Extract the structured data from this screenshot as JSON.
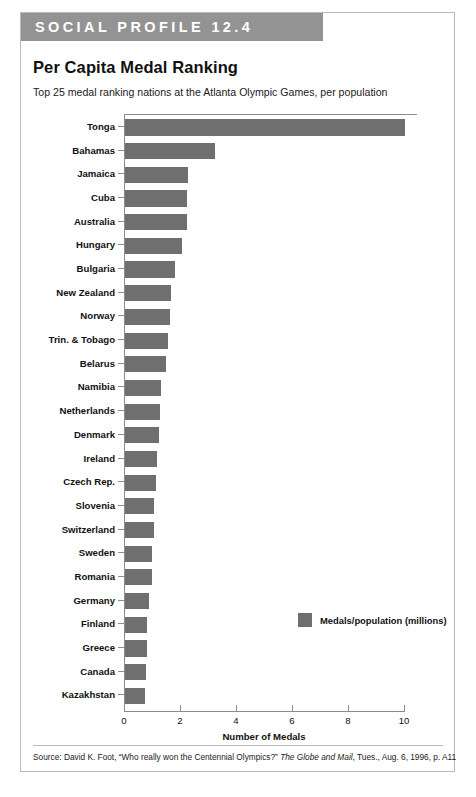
{
  "banner": {
    "label": "SOCIAL PROFILE 12.4"
  },
  "title": "Per Capita Medal Ranking",
  "subtitle": "Top 25 medal ranking nations at the Atlanta Olympic Games, per population",
  "legend": {
    "label": "Medals/population (millions)",
    "swatch_color": "#6f6f6f"
  },
  "source": {
    "prefix": "Source: David K. Foot, “Who really won the Centennial Olympics?” ",
    "publication": "The Globe and Mail",
    "suffix": ", Tues., Aug. 6, 1996, p. A11"
  },
  "colors": {
    "bar": "#6f6f6f",
    "banner": "#939393",
    "axis": "#8d8d8d",
    "card_border": "#b9b9b9",
    "background": "#ffffff"
  },
  "chart_data": {
    "type": "bar",
    "orientation": "horizontal",
    "title": "Per Capita Medal Ranking",
    "subtitle": "Top 25 medal ranking nations at the Atlanta Olympic Games, per population",
    "xlabel": "Number of Medals",
    "ylabel": "",
    "xlim": [
      0,
      10
    ],
    "xticks": [
      0,
      2,
      4,
      6,
      8,
      10
    ],
    "xtick_labels": [
      "0",
      "2",
      "4",
      "6",
      "8",
      "10"
    ],
    "grid": false,
    "legend_position": "inside-right",
    "series_name": "Medals/population (millions)",
    "categories": [
      "Tonga",
      "Bahamas",
      "Jamaica",
      "Cuba",
      "Australia",
      "Hungary",
      "Bulgaria",
      "New Zealand",
      "Norway",
      "Trin. & Tobago",
      "Belarus",
      "Namibia",
      "Netherlands",
      "Denmark",
      "Ireland",
      "Czech Rep.",
      "Slovenia",
      "Switzerland",
      "Sweden",
      "Romania",
      "Germany",
      "Finland",
      "Greece",
      "Canada",
      "Kazakhstan"
    ],
    "values": [
      10.0,
      3.2,
      2.25,
      2.2,
      2.2,
      2.05,
      1.8,
      1.65,
      1.6,
      1.55,
      1.45,
      1.3,
      1.25,
      1.2,
      1.15,
      1.1,
      1.05,
      1.05,
      0.95,
      0.95,
      0.85,
      0.8,
      0.8,
      0.75,
      0.7
    ]
  }
}
